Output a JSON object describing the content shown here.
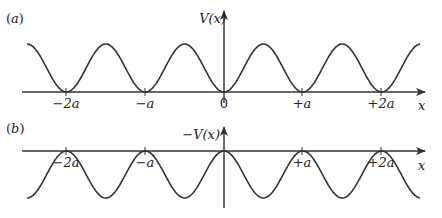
{
  "figure": {
    "panels": [
      {
        "id": "a",
        "label": "(a)",
        "y_label": "V(x)",
        "x_label": "x",
        "function": "V(x) = V0 * (1 - cos(2*pi*x/a)) / 2",
        "minima_at": [
          "-2a",
          "-a",
          "0",
          "+a",
          "+2a"
        ],
        "tick_labels": [
          "−2a",
          "−a",
          "0",
          "+a",
          "+2a"
        ]
      },
      {
        "id": "b",
        "label": "(b)",
        "y_label": "−V(x)",
        "x_label": "x",
        "function": "-V(x)",
        "maxima_at": [
          "-2a",
          "-a",
          "0",
          "+a",
          "+2a"
        ],
        "tick_labels": [
          "−2a",
          "−a",
          "",
          "+a",
          "+2a"
        ]
      }
    ],
    "colors": {
      "line": "#333333",
      "text": "#222222",
      "background": "#ffffff"
    }
  }
}
